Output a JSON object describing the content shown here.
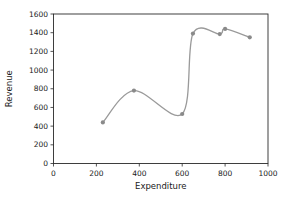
{
  "chart_data": {
    "type": "line",
    "title": "",
    "xlabel": "Expenditure",
    "ylabel": "Revenue",
    "x": [
      230,
      375,
      600,
      650,
      775,
      800,
      915
    ],
    "y": [
      440,
      780,
      530,
      1390,
      1385,
      1440,
      1350
    ],
    "xlim": [
      0,
      1000
    ],
    "ylim": [
      0,
      1600
    ],
    "xticks": [
      0,
      200,
      400,
      600,
      800,
      1000
    ],
    "yticks": [
      0,
      200,
      400,
      600,
      800,
      1000,
      1200,
      1400,
      1600
    ],
    "grid": false,
    "legend_position": "none",
    "smooth": true,
    "line_color": "#9a9a9a",
    "marker_color": "#8a8a8a",
    "spine_color": "#2a2a2a",
    "background": "#ffffff"
  }
}
